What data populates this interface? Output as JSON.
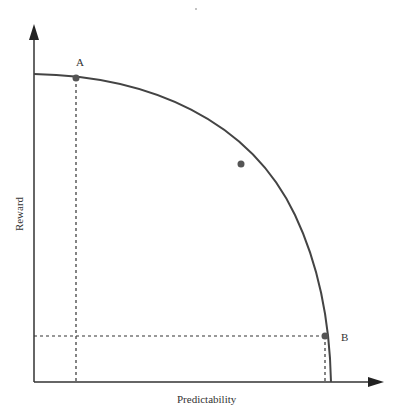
{
  "diagram": {
    "type": "frontier-curve",
    "x_axis_label": "Predictability",
    "y_axis_label": "Reward",
    "points": [
      {
        "label": "A",
        "x": 76,
        "y": 78
      },
      {
        "label": "",
        "x": 241,
        "y": 164
      },
      {
        "label": "B",
        "x": 325,
        "y": 336
      }
    ],
    "colors": {
      "line": "#444444",
      "point": "#555555",
      "text": "#333333"
    }
  }
}
